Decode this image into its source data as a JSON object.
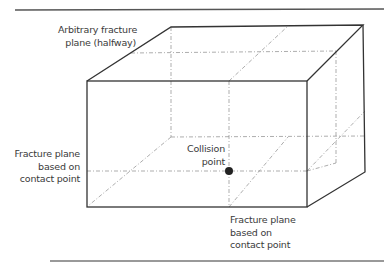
{
  "diagram": {
    "title": "",
    "labels": {
      "arbitrary_plane": {
        "line1": "Arbitrary fracture",
        "line2": "plane (halfway)"
      },
      "left_plane": {
        "line1": "Fracture plane",
        "line2": "based on",
        "line3": "contact point"
      },
      "collision": {
        "line1": "Collision",
        "line2": "point"
      },
      "bottom_plane": {
        "line1": "Fracture plane",
        "line2": "based on",
        "line3": "contact point"
      }
    },
    "colors": {
      "stroke": "#333333",
      "dashed": "#8a8a8a",
      "point": "#222222",
      "rule": "#555555"
    }
  }
}
